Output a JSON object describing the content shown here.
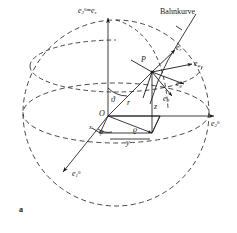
{
  "figure": {
    "caption": "a",
    "type": "spherical-coordinate-diagram",
    "language": "de",
    "ink_color": "#1a1a1a",
    "background_color": "#ffffff"
  },
  "annotations": {
    "curve_label": "Bahnkurve",
    "point_label": "P",
    "origin_label": "O"
  },
  "axes": [
    {
      "name": "axis-e1",
      "base": "e",
      "sub": "1",
      "sup": "0",
      "text": "e₁⁰"
    },
    {
      "name": "axis-e2",
      "base": "e",
      "sub": "2",
      "sup": "0",
      "text": "e₂⁰"
    },
    {
      "name": "axis-e3",
      "base": "e",
      "sub": "3",
      "sup": "0",
      "text": "e₃⁰ = e_z",
      "equals": "=",
      "second_base": "e",
      "second_sub": "z"
    }
  ],
  "unit_vectors": [
    {
      "name": "e-r",
      "base": "e",
      "sub": "r"
    },
    {
      "name": "e-phi",
      "base": "e",
      "sub": "φ"
    },
    {
      "name": "e-rho",
      "base": "e",
      "sub": "ϱ"
    },
    {
      "name": "e-theta",
      "base": "e",
      "sub": "ϑ"
    }
  ],
  "coordinates": {
    "radius": "r",
    "cyl_radius": "ϱ",
    "height": "z",
    "x": "x",
    "y": "y"
  },
  "angles": {
    "polar": "ϑ",
    "azimuth": "φ"
  }
}
